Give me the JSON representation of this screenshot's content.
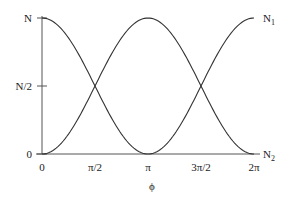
{
  "chart_data": {
    "type": "line",
    "title": "",
    "xlabel": "ϕ",
    "ylabel": "",
    "x_ticks": [
      {
        "value": 0,
        "label": "0"
      },
      {
        "value": 1.5708,
        "label": "π/2"
      },
      {
        "value": 3.1416,
        "label": "π"
      },
      {
        "value": 4.7124,
        "label": "3π/2"
      },
      {
        "value": 6.2832,
        "label": "2π"
      }
    ],
    "y_ticks": [
      {
        "value": 0,
        "label": "0"
      },
      {
        "value": 0.5,
        "label": "N/2"
      },
      {
        "value": 1,
        "label": "N"
      }
    ],
    "xlim": [
      0,
      6.2832
    ],
    "ylim": [
      0,
      1
    ],
    "grid": false,
    "legend_position": "inline-right",
    "series": [
      {
        "name": "N1",
        "label_main": "N",
        "label_sub": "1",
        "formula": "N*sin^2(phi/2)",
        "x": [
          0,
          0.7854,
          1.5708,
          2.3562,
          3.1416,
          3.927,
          4.7124,
          5.4978,
          6.2832
        ],
        "values": [
          1,
          0.854,
          0.5,
          0.146,
          0,
          0.146,
          0.5,
          0.854,
          1
        ]
      },
      {
        "name": "N2",
        "label_main": "N",
        "label_sub": "2",
        "formula": "N*cos^2(phi/2)",
        "x": [
          0,
          0.7854,
          1.5708,
          2.3562,
          3.1416,
          3.927,
          4.7124,
          5.4978,
          6.2832
        ],
        "values": [
          0,
          0.146,
          0.5,
          0.854,
          1,
          0.854,
          0.5,
          0.146,
          0
        ]
      }
    ]
  },
  "colors": {
    "line": "#333333",
    "axis": "#555555",
    "text": "#222222"
  }
}
